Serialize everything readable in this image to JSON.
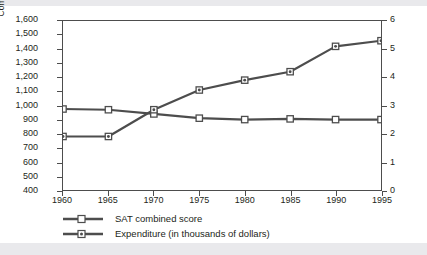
{
  "chart_data": {
    "type": "line",
    "title": "",
    "xlabel": "",
    "ylabel": "Combined SAT Score",
    "y2label": "Expenditure (thousands of dollars)",
    "x": [
      1960,
      1965,
      1970,
      1975,
      1980,
      1985,
      1990,
      1995
    ],
    "xticklabels": [
      "1960",
      "1965",
      "1970",
      "1975",
      "1980",
      "1985",
      "1990",
      "1995"
    ],
    "xlim": [
      1960,
      1995
    ],
    "ylim": [
      400,
      1600
    ],
    "yticks": [
      400,
      500,
      600,
      700,
      800,
      900,
      1000,
      1100,
      1200,
      1300,
      1400,
      1500,
      1600
    ],
    "yticklabels": [
      "400",
      "500",
      "600",
      "700",
      "800",
      "900",
      "1,000",
      "1,100",
      "1,200",
      "1,300",
      "1,400",
      "1,500",
      "1,600"
    ],
    "y2lim": [
      0,
      6
    ],
    "y2ticks": [
      0,
      1,
      2,
      3,
      4,
      5,
      6
    ],
    "y2ticklabels": [
      "0",
      "1",
      "2",
      "3",
      "4",
      "5",
      "6"
    ],
    "grid": false,
    "legend_position": "below-left",
    "series": [
      {
        "name": "SAT combined score",
        "axis": "left",
        "marker": "open-square",
        "color": "#4d4d4d",
        "values": [
          975,
          970,
          940,
          910,
          900,
          905,
          900,
          900
        ]
      },
      {
        "name": "Expenditure (in thousands of dollars)",
        "axis": "right",
        "marker": "dotted-square",
        "color": "#4d4d4d",
        "values": [
          1.9,
          1.9,
          2.85,
          3.55,
          3.9,
          4.2,
          5.1,
          5.3
        ]
      }
    ]
  },
  "legend": {
    "items": [
      {
        "label": "SAT combined score"
      },
      {
        "label": "Expenditure (in thousands of dollars)"
      }
    ]
  },
  "colors": {
    "line": "#4d4d4d",
    "axis": "#4d4d4d",
    "text": "#231f20",
    "background": "#ffffff",
    "band": "#e9e9ec"
  }
}
